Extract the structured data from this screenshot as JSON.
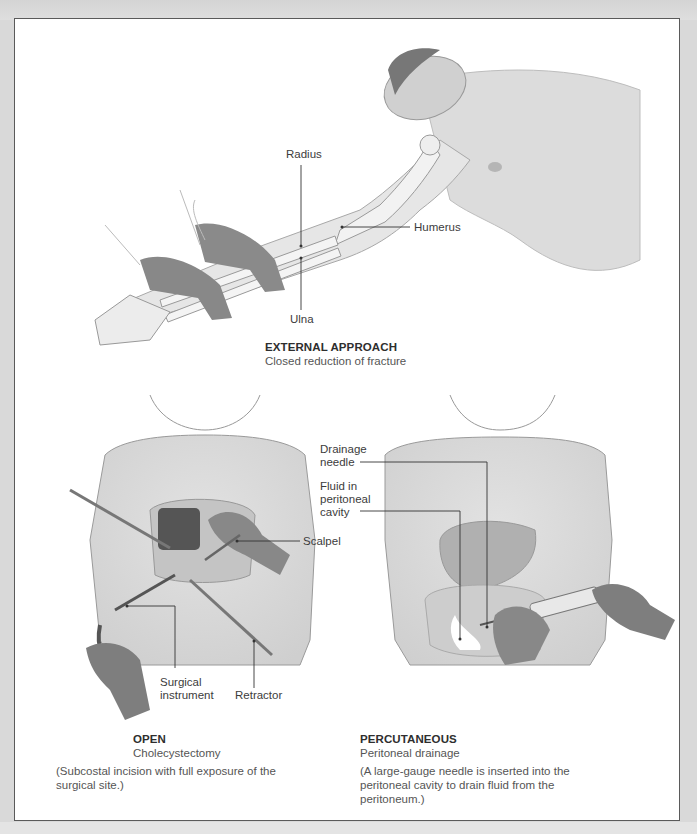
{
  "figure": {
    "panels": [
      {
        "id": "external",
        "title": "EXTERNAL APPROACH",
        "subtitle": "Closed reduction of fracture",
        "labels": {
          "radius": "Radius",
          "humerus": "Humerus",
          "ulna": "Ulna"
        }
      },
      {
        "id": "open",
        "title": "OPEN",
        "subtitle": "Cholecystectomy",
        "description": "(Subcostal incision with full exposure of the surgical site.)",
        "labels": {
          "scalpel": "Scalpel",
          "surgical_instrument": "Surgical\ninstrument",
          "retractor": "Retractor"
        }
      },
      {
        "id": "percutaneous",
        "title": "PERCUTANEOUS",
        "subtitle": "Peritoneal drainage",
        "description": "(A large-gauge needle is inserted into the peritoneal cavity to drain fluid from the peritoneum.)",
        "labels": {
          "drainage_needle": "Drainage\nneedle",
          "fluid": "Fluid in\nperitoneal\ncavity"
        }
      }
    ]
  }
}
